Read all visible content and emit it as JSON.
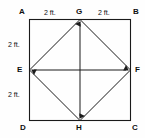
{
  "figure": {
    "background_color": "#fefefe",
    "line_color": "#1a1a1a",
    "label_color": "#0f0f0f",
    "vertices": [
      {
        "id": "A",
        "label": "A",
        "role": "square-corner",
        "position": "top-left"
      },
      {
        "id": "B",
        "label": "B",
        "role": "square-corner",
        "position": "top-right"
      },
      {
        "id": "C",
        "label": "C",
        "role": "square-corner",
        "position": "bottom-right"
      },
      {
        "id": "D",
        "label": "D",
        "role": "square-corner",
        "position": "bottom-left"
      },
      {
        "id": "E",
        "label": "E",
        "role": "midpoint",
        "position": "left-middle"
      },
      {
        "id": "F",
        "label": "F",
        "role": "midpoint",
        "position": "right-middle"
      },
      {
        "id": "G",
        "label": "G",
        "role": "midpoint",
        "position": "top-middle"
      },
      {
        "id": "H",
        "label": "H",
        "role": "midpoint",
        "position": "bottom-middle"
      }
    ],
    "dimensions": [
      {
        "id": "top-left",
        "label": "2 ft.",
        "segment": "A-G"
      },
      {
        "id": "top-right",
        "label": "2 ft.",
        "segment": "G-B"
      },
      {
        "id": "left-top",
        "label": "2 ft.",
        "segment": "A-E"
      },
      {
        "id": "left-bottom",
        "label": "2 ft.",
        "segment": "E-D"
      }
    ],
    "arrow_endpoints": [
      "G",
      "H",
      "E",
      "F"
    ]
  }
}
